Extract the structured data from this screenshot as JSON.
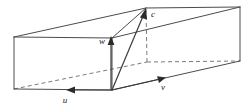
{
  "figure": {
    "title": "Parallelepiped spanned by vectors u, v, w with vector c",
    "background_color": "#ffffff",
    "edge_color": "#4c4c4c",
    "hidden_edge_color": "#7a7a7a",
    "vector_color": "#2b2b2b",
    "label_color": "#1a1a1a",
    "labels": {
      "vector_u": "u",
      "vector_v": "v",
      "vector_w": "w",
      "vector_c": "c"
    },
    "geometry": {
      "origin": [
        112,
        90
      ],
      "vertices": {
        "front_bottom_left": [
          14,
          89
        ],
        "front_top_left": [
          14,
          37
        ],
        "front_bottom_right": [
          112,
          90
        ],
        "front_top_right": [
          112,
          38
        ],
        "back_bottom_left": [
          147,
          62
        ],
        "back_top_left": [
          146,
          8
        ],
        "back_bottom_right": [
          240,
          61
        ],
        "back_top_right": [
          240,
          7
        ]
      },
      "vector_tips": {
        "u": [
          68,
          90
        ],
        "v": [
          165,
          76
        ],
        "w": [
          111,
          37
        ],
        "c": [
          146,
          8
        ]
      }
    }
  }
}
